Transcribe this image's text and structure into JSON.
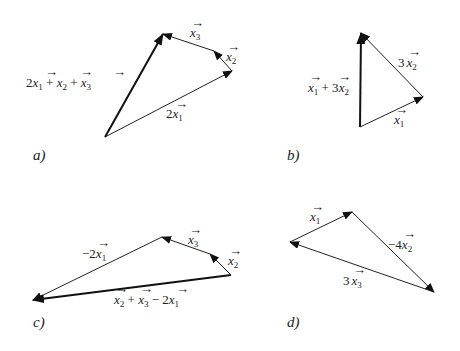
{
  "diagrams": [
    {
      "panel_label": "a)",
      "vectors": [
        {
          "label": "2x1",
          "display": "2⃗x₁",
          "from": [
            105,
            137
          ],
          "to": [
            232,
            71
          ],
          "bold": false
        },
        {
          "label": "x2",
          "display": "x₂",
          "from": [
            232,
            71
          ],
          "to": [
            214,
            51
          ],
          "bold": false
        },
        {
          "label": "x3",
          "display": "x₃",
          "from": [
            214,
            51
          ],
          "to": [
            163,
            34
          ],
          "bold": false
        },
        {
          "label": "2x1 + x2 + x3",
          "display": "2x₁ + x₂ + x₃",
          "from": [
            105,
            137
          ],
          "to": [
            163,
            34
          ],
          "bold": true
        }
      ]
    },
    {
      "panel_label": "b)",
      "vectors": [
        {
          "label": "x1",
          "from": [
            360,
            127
          ],
          "to": [
            423,
            97
          ],
          "bold": false
        },
        {
          "label": "3x2",
          "from": [
            423,
            97
          ],
          "to": [
            361,
            33
          ],
          "bold": false
        },
        {
          "label": "x1 + 3x2",
          "from": [
            360,
            127
          ],
          "to": [
            361,
            33
          ],
          "bold": true
        }
      ]
    },
    {
      "panel_label": "c)",
      "vectors": [
        {
          "label": "x2",
          "from": [
            231,
            275
          ],
          "to": [
            210,
            254
          ],
          "bold": false
        },
        {
          "label": "x3",
          "from": [
            210,
            254
          ],
          "to": [
            162,
            237
          ],
          "bold": false
        },
        {
          "label": "-2x1",
          "from": [
            162,
            237
          ],
          "to": [
            33,
            300
          ],
          "bold": false
        },
        {
          "label": "x2 + x3 - 2x1",
          "from": [
            231,
            275
          ],
          "to": [
            33,
            300
          ],
          "bold": true
        }
      ]
    },
    {
      "panel_label": "d)",
      "vectors": [
        {
          "label": "x1",
          "from": [
            290,
            242
          ],
          "to": [
            352,
            212
          ],
          "bold": false
        },
        {
          "label": "-4x2",
          "from": [
            352,
            212
          ],
          "to": [
            434,
            292
          ],
          "bold": false
        },
        {
          "label": "3x3",
          "from": [
            434,
            292
          ],
          "to": [
            290,
            242
          ],
          "bold": false
        }
      ]
    }
  ],
  "labels": {
    "a": {
      "panel": "a)",
      "sum": [
        "2",
        "x",
        "1",
        " + ",
        "x",
        "2",
        " + ",
        "x",
        "3"
      ],
      "v2x1": [
        "2",
        "x",
        "1"
      ],
      "vx2": [
        "x",
        "2"
      ],
      "vx3": [
        "x",
        "3"
      ]
    },
    "b": {
      "panel": "b)",
      "sum": [
        "x",
        "1",
        " + 3",
        "x",
        "2"
      ],
      "v3x2": [
        "3",
        "x",
        "2"
      ],
      "vx1": [
        "x",
        "1"
      ]
    },
    "c": {
      "panel": "c)",
      "sum": [
        "x",
        "2",
        " + ",
        "x",
        "3",
        " − 2",
        "x",
        "1"
      ],
      "vm2x1": [
        "−2",
        "x",
        "1"
      ],
      "vx2": [
        "x",
        "2"
      ],
      "vx3": [
        "x",
        "3"
      ]
    },
    "d": {
      "panel": "d)",
      "vx1": [
        "x",
        "1"
      ],
      "vm4x2": [
        "−4",
        "x",
        "2"
      ],
      "v3x3": [
        "3",
        "x",
        "3"
      ]
    }
  }
}
